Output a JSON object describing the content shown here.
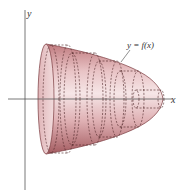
{
  "figure": {
    "axes": {
      "x_label": "x",
      "y_label": "y"
    },
    "curve_label": "y = f(x)",
    "colors": {
      "solid_fill_light": "#f3dfe0",
      "solid_fill_dark": "#b86e72",
      "outline": "#7a3a3e",
      "dashes": "#4a2224",
      "axis": "#555555"
    },
    "disk_count": 5
  }
}
